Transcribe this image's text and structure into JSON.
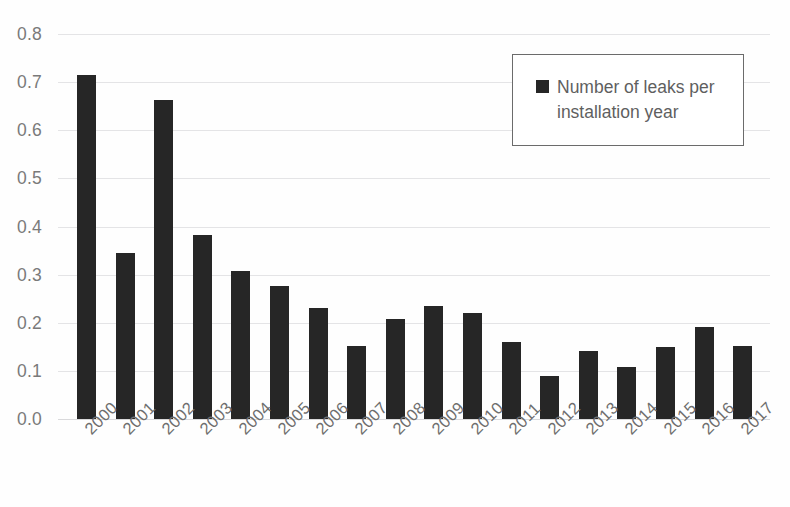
{
  "chart_data": {
    "type": "bar",
    "title": "",
    "subtitle": "",
    "xlabel": "",
    "ylabel": "",
    "categories": [
      "2000",
      "2001",
      "2002",
      "2003",
      "2004",
      "2005",
      "2006",
      "2007",
      "2008",
      "2009",
      "2010",
      "2011",
      "2012",
      "2013",
      "2014",
      "2015",
      "2016",
      "2017"
    ],
    "values": [
      0.715,
      0.345,
      0.663,
      0.383,
      0.308,
      0.277,
      0.23,
      0.151,
      0.207,
      0.234,
      0.22,
      0.16,
      0.089,
      0.141,
      0.108,
      0.149,
      0.191,
      0.152
    ],
    "series": [
      {
        "name": "Number of leaks per installation year",
        "values": [
          0.715,
          0.345,
          0.663,
          0.383,
          0.308,
          0.277,
          0.23,
          0.151,
          0.207,
          0.234,
          0.22,
          0.16,
          0.089,
          0.141,
          0.108,
          0.149,
          0.191,
          0.152
        ]
      }
    ],
    "ylim": [
      0.0,
      0.8
    ],
    "ytick_labels": [
      "0.0",
      "0.1",
      "0.2",
      "0.3",
      "0.4",
      "0.5",
      "0.6",
      "0.7",
      "0.8"
    ],
    "ytick_values": [
      0.0,
      0.1,
      0.2,
      0.3,
      0.4,
      0.5,
      0.6,
      0.7,
      0.8
    ],
    "grid": true,
    "grid_axis": "y",
    "legend_position": "top-right",
    "bar_color": "#262626",
    "gridline_color": "#e4e4e6",
    "axis_label_color": "#7a7a7a",
    "background_color": "#fefefe",
    "xtick_rotation": -45
  },
  "legend": {
    "entries": [
      {
        "label": "Number of leaks per installation year",
        "color": "#262626",
        "marker": "square-marker"
      }
    ],
    "border_color": "#6b6b6b"
  }
}
